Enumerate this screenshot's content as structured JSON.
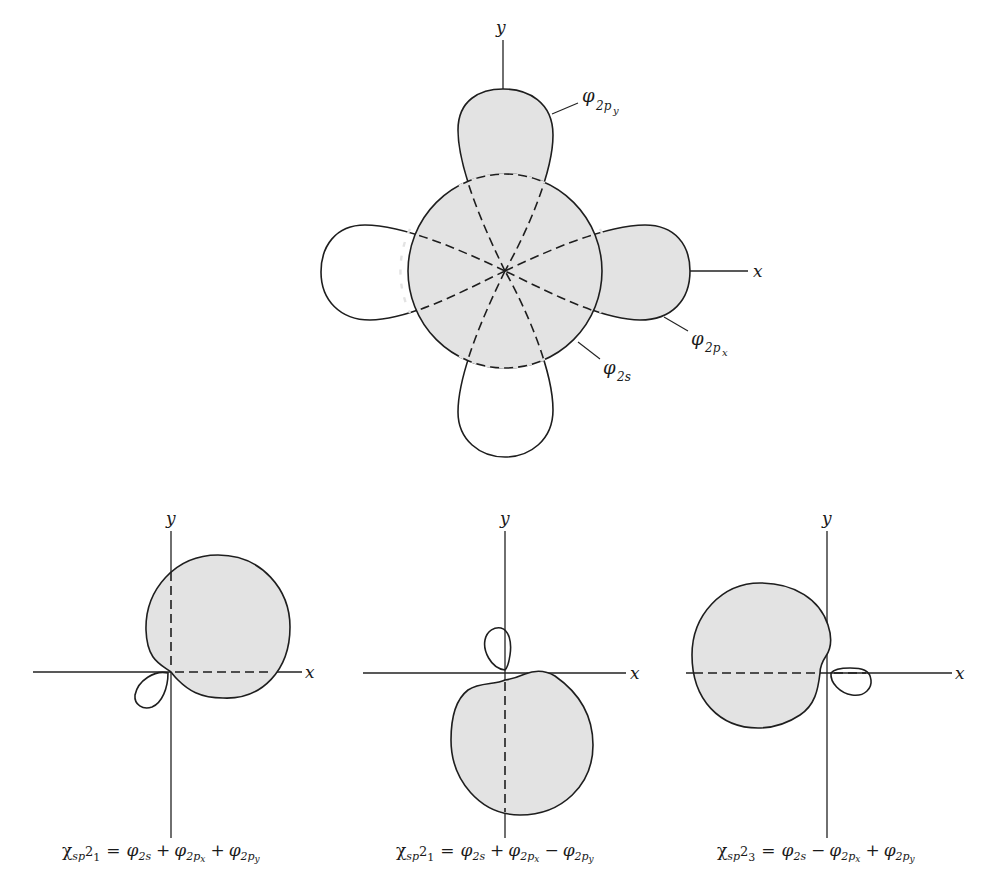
{
  "colors": {
    "shade": "#e3e3e3",
    "line": "#1e1e1e",
    "background": "#ffffff"
  },
  "top_figure": {
    "axis_x_label": "x",
    "axis_y_label": "y",
    "labels": {
      "phi_2py": {
        "symbol": "φ",
        "sub": "2p",
        "subsub": "y"
      },
      "phi_2px": {
        "symbol": "φ",
        "sub": "2p",
        "subsub": "x"
      },
      "phi_2s": {
        "symbol": "φ",
        "sub": "2s"
      }
    },
    "components": [
      {
        "name": "2s orbital",
        "shape": "circle",
        "shaded": true
      },
      {
        "name": "2px orbital positive lobe",
        "direction": "+x",
        "shaded": true
      },
      {
        "name": "2px orbital negative lobe",
        "direction": "-x",
        "shaded": false
      },
      {
        "name": "2py orbital positive lobe",
        "direction": "+y",
        "shaded": true
      },
      {
        "name": "2py orbital negative lobe",
        "direction": "-y",
        "shaded": false
      }
    ]
  },
  "hybrids": [
    {
      "axis_x_label": "x",
      "axis_y_label": "y",
      "caption": {
        "chi": "χ",
        "sub": "sp",
        "sup": "2",
        "index": "1",
        "eq": "=",
        "t1": "φ",
        "t1sub": "2s",
        "op1": "+",
        "t2": "φ",
        "t2sub": "2p",
        "t2subsub": "x",
        "op2": "+",
        "t3": "φ",
        "t3sub": "2p",
        "t3subsub": "y"
      },
      "main_lobe_direction": "+x+y (45°)"
    },
    {
      "axis_x_label": "x",
      "axis_y_label": "y",
      "caption": {
        "chi": "χ",
        "sub": "sp",
        "sup": "2",
        "index": "1",
        "eq": "=",
        "t1": "φ",
        "t1sub": "2s",
        "op1": "+",
        "t2": "φ",
        "t2sub": "2p",
        "t2subsub": "x",
        "op2": "−",
        "t3": "φ",
        "t3sub": "2p",
        "t3subsub": "y"
      },
      "main_lobe_direction": "-y"
    },
    {
      "axis_x_label": "x",
      "axis_y_label": "y",
      "caption": {
        "chi": "χ",
        "sub": "sp",
        "sup": "2",
        "index": "3",
        "eq": "=",
        "t1": "φ",
        "t1sub": "2s",
        "op1": "−",
        "t2": "φ",
        "t2sub": "2p",
        "t2subsub": "x",
        "op2": "+",
        "t3": "φ",
        "t3sub": "2p",
        "t3subsub": "y"
      },
      "main_lobe_direction": "-x"
    }
  ]
}
